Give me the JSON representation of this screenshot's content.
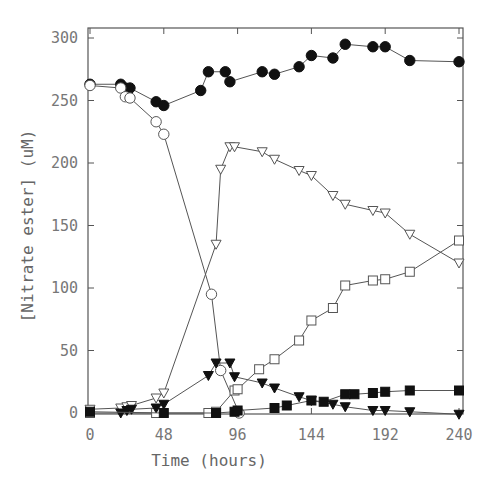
{
  "chart_data": {
    "type": "line",
    "title": "",
    "xlabel": "Time (hours)",
    "ylabel": "[Nitrate ester] (uM)",
    "xlim": [
      0,
      240
    ],
    "ylim": [
      0,
      300
    ],
    "xticks": [
      0,
      48,
      96,
      144,
      192,
      240
    ],
    "yticks": [
      0,
      50,
      100,
      150,
      200,
      250,
      300
    ],
    "grid": false,
    "legend": "none",
    "series": [
      {
        "name": "filled-circle",
        "marker": "circle",
        "filled": true,
        "x": [
          0,
          20,
          23,
          26,
          43,
          48,
          72,
          77,
          88,
          91,
          112,
          120,
          136,
          144,
          158,
          166,
          184,
          192,
          208,
          240
        ],
        "y": [
          263,
          263,
          260,
          260,
          249,
          246,
          258,
          273,
          273,
          265,
          273,
          271,
          277,
          286,
          284,
          295,
          293,
          293,
          282,
          281
        ]
      },
      {
        "name": "open-circle",
        "marker": "circle",
        "filled": false,
        "x": [
          0,
          20,
          23,
          26,
          43,
          48,
          79,
          85,
          97
        ],
        "y": [
          262,
          260,
          253,
          252,
          233,
          223,
          95,
          34,
          0
        ]
      },
      {
        "name": "open-triangle-down",
        "marker": "triangle-down",
        "filled": false,
        "x": [
          0,
          20,
          24,
          27,
          43,
          48,
          82,
          85,
          91,
          94,
          112,
          120,
          136,
          144,
          158,
          166,
          184,
          192,
          208,
          240
        ],
        "y": [
          3,
          4,
          5,
          6,
          12,
          16,
          135,
          195,
          213,
          213,
          209,
          203,
          194,
          190,
          174,
          167,
          162,
          160,
          143,
          120
        ]
      },
      {
        "name": "open-square",
        "marker": "square",
        "filled": false,
        "x": [
          0,
          43,
          77,
          82,
          94,
          96,
          110,
          120,
          136,
          144,
          158,
          166,
          184,
          192,
          208,
          240
        ],
        "y": [
          0,
          0,
          0,
          1,
          18,
          19,
          35,
          43,
          58,
          74,
          84,
          102,
          106,
          107,
          113,
          138
        ]
      },
      {
        "name": "filled-triangle-down",
        "marker": "triangle-down",
        "filled": true,
        "x": [
          20,
          24,
          27,
          43,
          48,
          77,
          82,
          91,
          94,
          112,
          120,
          136,
          144,
          158,
          166,
          184,
          192,
          208,
          240
        ],
        "y": [
          0,
          2,
          3,
          4,
          7,
          30,
          40,
          40,
          29,
          24,
          20,
          13,
          10,
          7,
          5,
          2,
          2,
          1,
          -1
        ]
      },
      {
        "name": "filled-square",
        "marker": "square",
        "filled": true,
        "x": [
          0,
          48,
          82,
          94,
          96,
          120,
          128,
          144,
          152,
          166,
          172,
          184,
          192,
          208,
          240
        ],
        "y": [
          1,
          0,
          0,
          1,
          2,
          4,
          6,
          10,
          9,
          15,
          15,
          16,
          17,
          18,
          18
        ]
      }
    ]
  },
  "colors": {
    "line": "#555555",
    "marker": "#111111",
    "axis": "#555555",
    "text": "#777777"
  }
}
